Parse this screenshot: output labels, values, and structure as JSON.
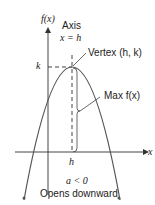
{
  "diagram": {
    "y_axis_label": "f(x)",
    "x_axis_label": "x",
    "axis_label": "Axis",
    "axis_equation": "x = h",
    "vertex_label": "Vertex (h, k)",
    "k_label": "k",
    "h_label": "h",
    "max_label": "Max f(x)",
    "condition": "a < 0",
    "caption": "Opens downward"
  }
}
